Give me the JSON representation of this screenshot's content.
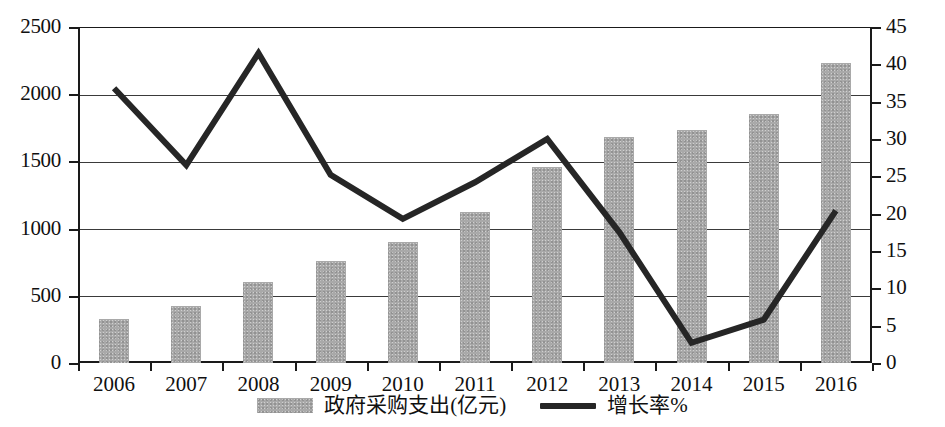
{
  "chart_data": {
    "type": "bar",
    "title": "",
    "subtitle": "",
    "xlabel": "",
    "ylabel": "",
    "categories": [
      "2006",
      "2007",
      "2008",
      "2009",
      "2010",
      "2011",
      "2012",
      "2013",
      "2014",
      "2015",
      "2016"
    ],
    "series": [
      {
        "name": "政府采购支出(亿元)",
        "type": "bar",
        "axis": "left",
        "color": "#a9a9a9",
        "values": [
          330,
          425,
          605,
          760,
          900,
          1120,
          1460,
          1685,
          1735,
          1855,
          2235
        ]
      },
      {
        "name": "增长率%",
        "type": "line",
        "axis": "right",
        "color": "#262626",
        "values": [
          36.8,
          26.5,
          41.5,
          25.2,
          19.3,
          24.2,
          30.0,
          17.5,
          2.7,
          5.8,
          20.4
        ]
      }
    ],
    "left_axis": {
      "ticks": [
        "0",
        "500",
        "1000",
        "1500",
        "2000",
        "2500"
      ],
      "values": [
        0,
        500,
        1000,
        1500,
        2000,
        2500
      ],
      "ylim": [
        0,
        2500
      ]
    },
    "right_axis": {
      "ticks": [
        "0",
        "5",
        "10",
        "15",
        "20",
        "25",
        "30",
        "35",
        "40",
        "45"
      ],
      "values": [
        0,
        5,
        10,
        15,
        20,
        25,
        30,
        35,
        40,
        45
      ],
      "ylim": [
        0,
        45
      ]
    },
    "gridlines": {
      "horizontal": [
        500,
        1000,
        1500,
        2000,
        2500
      ],
      "vertical": false
    },
    "legend": {
      "position": "bottom-center",
      "entries": [
        {
          "label": "政府采购支出(亿元)",
          "marker": "bar-swatch",
          "color": "#a9a9a9"
        },
        {
          "label": "增长率%",
          "marker": "line-swatch",
          "color": "#262626"
        }
      ]
    }
  }
}
